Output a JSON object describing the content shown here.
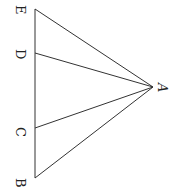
{
  "diagram": {
    "type": "geometry-figure",
    "orientation": "rotated-90-clockwise",
    "points": {
      "A": {
        "label": "A",
        "x": 153,
        "y": 87
      },
      "B": {
        "label": "B",
        "x": 35,
        "y": 178
      },
      "C": {
        "label": "C",
        "x": 35,
        "y": 128
      },
      "D": {
        "label": "D",
        "x": 35,
        "y": 53
      },
      "E": {
        "label": "E",
        "x": 35,
        "y": 9
      }
    },
    "segments": [
      {
        "from": "E",
        "to": "B"
      },
      {
        "from": "A",
        "to": "E"
      },
      {
        "from": "A",
        "to": "D"
      },
      {
        "from": "A",
        "to": "C"
      },
      {
        "from": "A",
        "to": "B"
      }
    ],
    "colors": {
      "line": "#333333",
      "text": "#222222",
      "background": "#ffffff"
    }
  }
}
